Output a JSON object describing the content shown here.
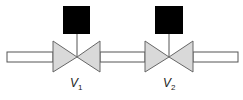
{
  "diagram": {
    "type": "valve-series",
    "pipe": {
      "fill": "#ffffff",
      "stroke": "#555555"
    },
    "valves": [
      {
        "id": "V1",
        "label": "V",
        "subscript": "1",
        "center_x": 77,
        "body_fill": "#d9d9d9",
        "actuator_fill": "#000000"
      },
      {
        "id": "V2",
        "label": "V",
        "subscript": "2",
        "center_x": 169,
        "body_fill": "#d9d9d9",
        "actuator_fill": "#000000"
      }
    ]
  }
}
